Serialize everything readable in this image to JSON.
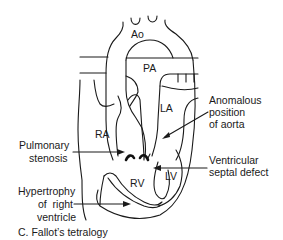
{
  "figure": {
    "caption": "C. Fallot’s tetralogy",
    "structures": {
      "aorta": "Ao",
      "pulmonary_artery": "PA",
      "left_atrium": "LA",
      "right_atrium": "RA",
      "right_ventricle": "RV",
      "left_ventricle": "LV"
    },
    "annotations": {
      "anomalous_aorta": [
        "Anomalous",
        "position",
        "of aorta"
      ],
      "pulmonary_stenosis": [
        "Pulmonary",
        "stenosis"
      ],
      "vsd": [
        "Ventricular",
        "septal defect"
      ],
      "rv_hypertrophy": [
        "Hypertrophy",
        "of  right",
        "ventricle"
      ]
    }
  },
  "colors": {
    "line": "#1a1a1a",
    "background": "#ffffff"
  }
}
